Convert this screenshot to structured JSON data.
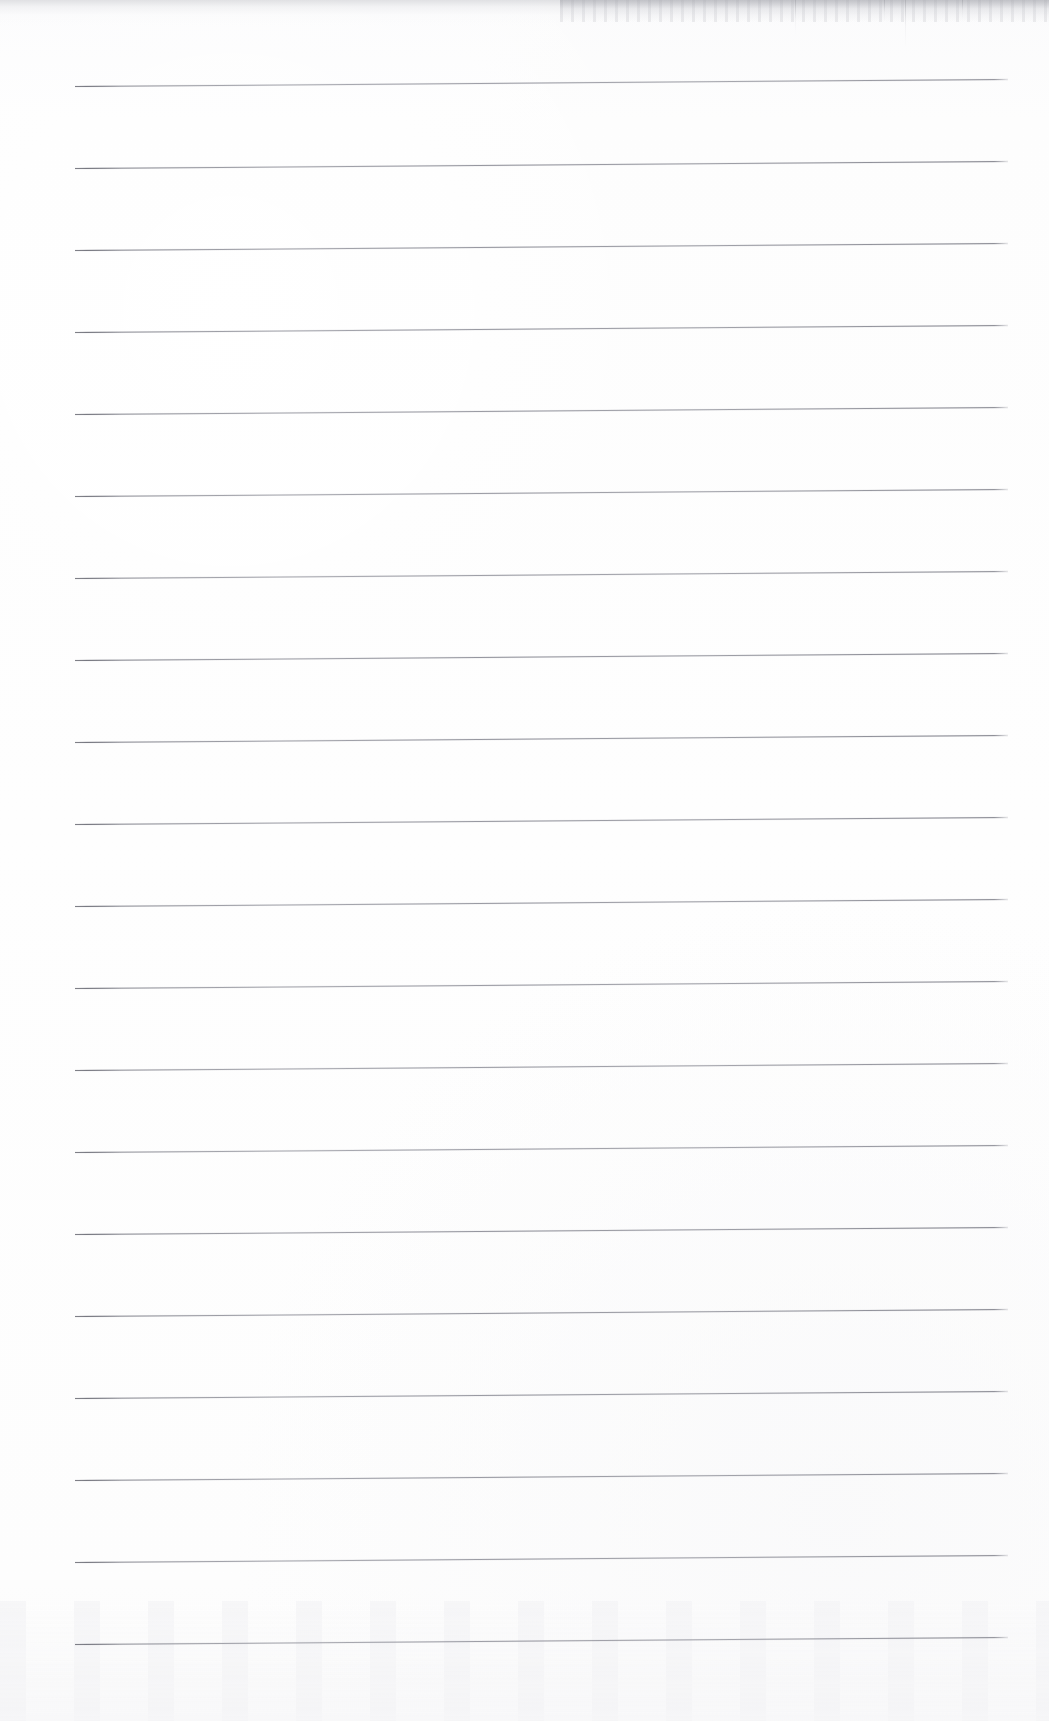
{
  "document": {
    "kind": "scanned-ruled-notebook-page",
    "title": "Blank Lined Notebook Page",
    "page_width": 1049,
    "page_height": 1721,
    "has_text": false,
    "has_handwriting": false,
    "has_margin_rule": false,
    "has_punch_holes": false,
    "orientation": "portrait"
  },
  "colors": {
    "paper": "#fdfdfd",
    "page_edge": "#ffffff",
    "rule_line": "#8a8b93",
    "rule_line_dark": "#767780",
    "top_fringe": "#c4c5ca",
    "bottom_mottle": "#f4f4f6"
  },
  "ruling": {
    "line_count": 20,
    "spacing_px": 82,
    "first_line_y": 86,
    "last_line_y": 1644,
    "left_x": 75,
    "right_x": 1008,
    "line_length_px": 933,
    "stroke_width_px": 1,
    "skew_rise_px": 7,
    "skew_degrees": -0.43,
    "left_margin_px": 75,
    "right_margin_px": 41,
    "top_margin_px": 86,
    "bottom_margin_px": 77,
    "line_y_positions": [
      86,
      168,
      250,
      332,
      414,
      496,
      578,
      660,
      742,
      824,
      906,
      988,
      1070,
      1152,
      1234,
      1316,
      1398,
      1480,
      1562,
      1644
    ]
  },
  "artifacts": {
    "top_edge_fringe": {
      "present": true,
      "height_px": 26,
      "note": "grey scanner fringe along top edge, heavier on right half"
    },
    "scan_streaks": [
      {
        "x": 795,
        "y": 0,
        "height": 34
      },
      {
        "x": 884,
        "y": 0,
        "height": 22
      },
      {
        "x": 905,
        "y": 0,
        "height": 48
      },
      {
        "x": 962,
        "y": 0,
        "height": 19
      }
    ],
    "bottom_mottle": {
      "present": true,
      "height_px": 120,
      "note": "faint mottled dust band across the foot of the page"
    }
  },
  "content": {
    "text_lines": [],
    "empty_message": ""
  }
}
